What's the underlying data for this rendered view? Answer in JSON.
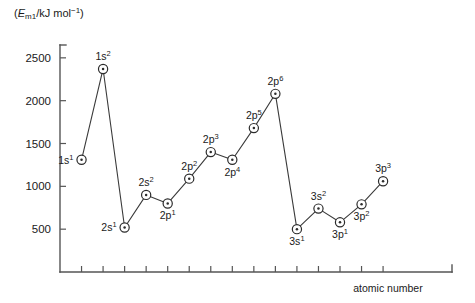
{
  "chart_data": {
    "type": "line",
    "title": "",
    "subtitle": "",
    "ylabel": "(Em1/kJ mol^-1)",
    "ylabel_parts": {
      "open": "(",
      "symbol": "E",
      "sub": "m1",
      "slash": "/kJ mol",
      "sup": "−1",
      "close": ")"
    },
    "xlabel": "atomic number",
    "ylim": [
      0,
      2650
    ],
    "xlim": [
      0,
      18.2
    ],
    "yticks": [
      500,
      1000,
      1500,
      2000,
      2500
    ],
    "ytick_labels": [
      "500",
      "1000",
      "1500",
      "2000",
      "2500"
    ],
    "xticks": [
      1,
      2,
      3,
      4,
      5,
      6,
      7,
      8,
      9,
      10,
      11,
      12,
      13,
      14,
      15
    ],
    "xtick_labels": [
      "",
      "",
      "",
      "",
      "",
      "",
      "",
      "",
      "",
      "",
      "",
      "",
      "",
      "",
      ""
    ],
    "grid": false,
    "legend": false,
    "marker": "circle-dot",
    "series": [
      {
        "name": "first ionisation energy",
        "x": [
          1,
          2,
          3,
          4,
          5,
          6,
          7,
          8,
          9,
          10,
          11,
          12,
          13,
          14,
          15
        ],
        "values": [
          1310,
          2370,
          520,
          900,
          800,
          1090,
          1400,
          1310,
          1680,
          2080,
          500,
          740,
          580,
          790,
          1060
        ],
        "labels": [
          "1s1",
          "1s2",
          "2s1",
          "2s2",
          "2p1",
          "2p2",
          "2p3",
          "2p4",
          "2p5",
          "2p6",
          "3s1",
          "3s2",
          "3p1",
          "3p2",
          "3p3"
        ],
        "label_parts": [
          {
            "base": "1s",
            "sup": "1"
          },
          {
            "base": "1s",
            "sup": "2"
          },
          {
            "base": "2s",
            "sup": "1"
          },
          {
            "base": "2s",
            "sup": "2"
          },
          {
            "base": "2p",
            "sup": "1"
          },
          {
            "base": "2p",
            "sup": "2"
          },
          {
            "base": "2p",
            "sup": "3"
          },
          {
            "base": "2p",
            "sup": "4"
          },
          {
            "base": "2p",
            "sup": "5"
          },
          {
            "base": "2p",
            "sup": "6"
          },
          {
            "base": "3s",
            "sup": "1"
          },
          {
            "base": "3s",
            "sup": "2"
          },
          {
            "base": "3p",
            "sup": "1"
          },
          {
            "base": "3p",
            "sup": "2"
          },
          {
            "base": "3p",
            "sup": "3"
          }
        ],
        "label_positions": [
          "left",
          "above",
          "left",
          "above",
          "below",
          "above",
          "above",
          "below",
          "above",
          "above",
          "below",
          "above",
          "below",
          "below",
          "above"
        ],
        "color": "#2b2b2b"
      }
    ],
    "colors": {
      "axis": "#555555",
      "line": "#3a3a3a",
      "marker_fill": "#ffffff",
      "marker_stroke": "#2b2b2b",
      "text": "#1a1a1a",
      "background": "#ffffff"
    }
  }
}
